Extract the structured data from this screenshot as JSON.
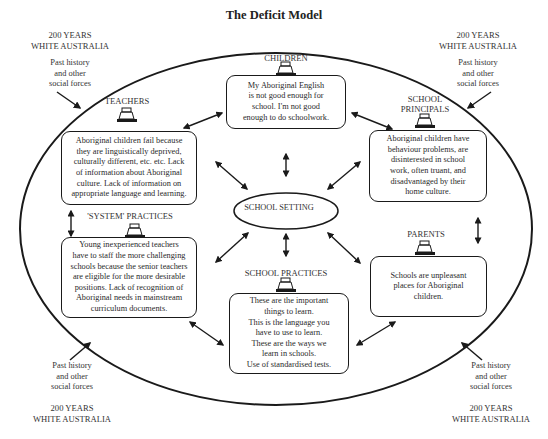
{
  "title": "The Deficit Model",
  "corners": {
    "top_left": {
      "years": "200 YEARS",
      "place": "WHITE AUSTRALIA",
      "forces": [
        "Past history",
        "and other",
        "social forces"
      ]
    },
    "top_right": {
      "years": "200 YEARS",
      "place": "WHITE AUSTRALIA",
      "forces": [
        "Past history",
        "and other",
        "social forces"
      ]
    },
    "bottom_left": {
      "years": "200 YEARS",
      "place": "WHITE AUSTRALIA",
      "forces": [
        "Past history",
        "and other",
        "social forces"
      ]
    },
    "bottom_right": {
      "years": "200 YEARS",
      "place": "WHITE AUSTRALIA",
      "forces": [
        "Past history",
        "and other",
        "social forces"
      ]
    }
  },
  "center": {
    "label": "SCHOOL SETTING"
  },
  "nodes": {
    "children": {
      "label": "CHILDREN",
      "lines": [
        "My Aboriginal English",
        "is not good enough for",
        "school. I'm not good",
        "enough to do schoolwork."
      ]
    },
    "teachers": {
      "label": "TEACHERS",
      "lines": [
        "Aboriginal children fail because",
        "they are linguistically deprived,",
        "culturally different, etc. etc. Lack",
        "of information about Aboriginal",
        "culture. Lack of information on",
        "appropriate language and learning."
      ]
    },
    "principals": {
      "label_line1": "SCHOOL",
      "label_line2": "PRINCIPALS",
      "lines": [
        "Aboriginal children have",
        "behaviour problems, are",
        "disinterested in school",
        "work, often truant, and",
        "disadvantaged by their",
        "home culture."
      ]
    },
    "system": {
      "label": "'SYSTEM' PRACTICES",
      "lines": [
        "Young inexperienced teachers",
        "have to staff the more challenging",
        "schools because the senior teachers",
        "are eligible for the more desirable",
        "positions. Lack of recognition of",
        "Aboriginal needs in mainstream",
        "curriculum documents."
      ]
    },
    "parents": {
      "label": "PARENTS",
      "lines": [
        "Schools are unpleasant",
        "places for Aboriginal",
        "children."
      ]
    },
    "school_practices": {
      "label": "SCHOOL PRACTICES",
      "lines": [
        "These are the important",
        "things to learn.",
        "This is the language you",
        "have to use to learn.",
        "These are the ways we",
        "learn in schools.",
        "Use of standardised tests."
      ]
    }
  },
  "colors": {
    "ink": "#1a1a1a",
    "text": "#2a2a2a",
    "background": "#ffffff"
  }
}
